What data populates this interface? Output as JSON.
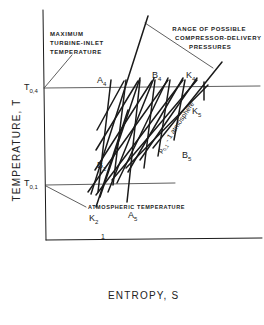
{
  "diagram": {
    "type": "T-s diagram",
    "x_axis_label": "ENTROPY, S",
    "y_axis_label": "TEMPERATURE, T",
    "levels": {
      "top": {
        "symbol": "T",
        "subscript": "0,4"
      },
      "bottom": {
        "symbol": "T",
        "subscript": "0,1"
      }
    },
    "annotations": {
      "max_turbine": [
        "MAXIMUM",
        "TURBINE-INLET",
        "TEMPERATURE"
      ],
      "range": [
        "RANGE OF POSSIBLE",
        "COMPRESSOR-DELIVERY",
        "PRESSURES"
      ],
      "atmospheric": "ATMOSPHERIC TEMPERATURE",
      "isobar": {
        "p": "p",
        "sub": "0,1",
        "rest": " - 1 atmosphere"
      }
    },
    "points": {
      "A4": {
        "l": "A",
        "s": "4"
      },
      "B4": {
        "l": "B",
        "s": "4"
      },
      "K4": {
        "l": "K",
        "s": "4"
      },
      "K5": {
        "l": "K",
        "s": "5"
      },
      "B2": {
        "l": "B",
        "s": "2"
      },
      "B5": {
        "l": "B",
        "s": "5"
      },
      "K2": {
        "l": "K",
        "s": "2"
      },
      "A5": {
        "l": "A",
        "s": "5"
      },
      "p1": {
        "l": "1",
        "s": ""
      }
    }
  }
}
